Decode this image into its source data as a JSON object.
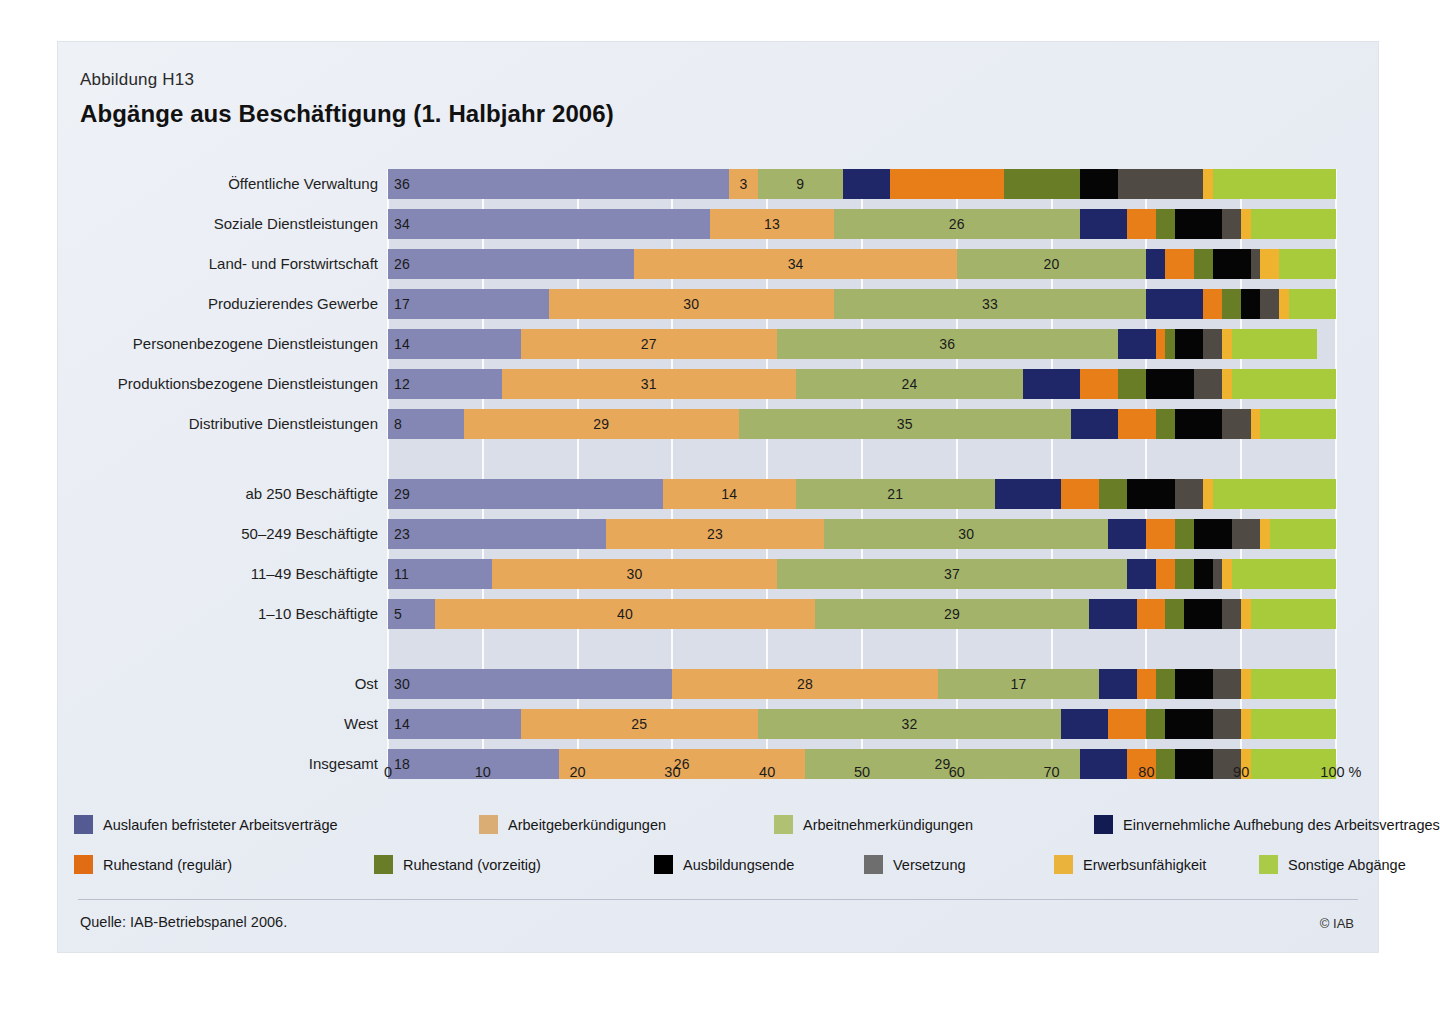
{
  "figure": {
    "number": "Abbildung H13",
    "title": "Abgänge aus Beschäftigung (1. Halbjahr 2006)",
    "source": "Quelle: IAB-Betriebspanel 2006.",
    "copyright": "© IAB"
  },
  "chart_data": {
    "type": "bar",
    "orientation": "horizontal",
    "stacked": true,
    "normalized_percent": true,
    "title": "Abgänge aus Beschäftigung (1. Halbjahr 2006)",
    "xlabel": "%",
    "ylabel": "",
    "xlim": [
      0,
      100
    ],
    "xticks": [
      "0",
      "10",
      "20",
      "30",
      "40",
      "50",
      "60",
      "70",
      "80",
      "90",
      "100 %"
    ],
    "grid": true,
    "legend_position": "bottom",
    "series": [
      {
        "name": "Auslaufen befristeter Arbeitsverträge",
        "color": "#8487b3",
        "values": [
          36,
          34,
          26,
          17,
          14,
          12,
          8,
          29,
          23,
          11,
          5,
          30,
          14,
          18
        ]
      },
      {
        "name": "Arbeitgeberkündigungen",
        "color": "#e8a85a",
        "values": [
          3,
          13,
          34,
          30,
          27,
          31,
          29,
          14,
          23,
          30,
          40,
          28,
          25,
          26
        ]
      },
      {
        "name": "Arbeitnehmerkündigungen",
        "color": "#a3b46a",
        "values": [
          9,
          26,
          20,
          33,
          36,
          24,
          35,
          21,
          30,
          37,
          29,
          17,
          32,
          29
        ]
      },
      {
        "name": "Einvernehmliche Aufhebung des Arbeitsvertrages",
        "color": "#1f2768",
        "values": [
          5,
          5,
          2,
          6,
          4,
          6,
          5,
          7,
          4,
          3,
          5,
          4,
          5,
          5
        ]
      },
      {
        "name": "Ruhestand (regulär)",
        "color": "#e87e18",
        "values": [
          12,
          3,
          3,
          2,
          1,
          4,
          4,
          4,
          3,
          2,
          3,
          2,
          4,
          3
        ]
      },
      {
        "name": "Ruhestand (vorzeitig)",
        "color": "#687d26",
        "values": [
          8,
          2,
          2,
          2,
          1,
          3,
          2,
          3,
          2,
          2,
          2,
          2,
          2,
          2
        ]
      },
      {
        "name": "Ausbildungsende",
        "color": "#050505",
        "values": [
          4,
          5,
          4,
          2,
          3,
          5,
          5,
          5,
          4,
          2,
          4,
          4,
          5,
          4
        ]
      },
      {
        "name": "Versetzung",
        "color": "#4f4a44",
        "values": [
          9,
          2,
          1,
          2,
          2,
          3,
          3,
          3,
          3,
          1,
          2,
          3,
          3,
          3
        ]
      },
      {
        "name": "Erwerbsunfähigkeit",
        "color": "#efb32f",
        "values": [
          1,
          1,
          2,
          1,
          1,
          1,
          1,
          1,
          1,
          1,
          1,
          1,
          1,
          1
        ]
      },
      {
        "name": "Sonstige Abgänge",
        "color": "#a8cb3c",
        "values": [
          13,
          9,
          6,
          5,
          9,
          11,
          8,
          13,
          7,
          11,
          9,
          9,
          9,
          9
        ]
      }
    ],
    "labeled_segments": [
      0,
      1,
      2
    ],
    "groups": [
      {
        "categories": [
          "Öffentliche Verwaltung",
          "Soziale Dienstleistungen",
          "Land- und Forstwirtschaft",
          "Produzierendes Gewerbe",
          "Personenbezogene Dienstleistungen",
          "Produktionsbezogene Dienstleistungen",
          "Distributive Dienstleistungen"
        ]
      },
      {
        "categories": [
          "ab 250 Beschäftigte",
          "50–249 Beschäftigte",
          "11–49 Beschäftigte",
          "1–10 Beschäftigte"
        ]
      },
      {
        "categories": [
          "Ost",
          "West",
          "Insgesamt"
        ]
      }
    ]
  },
  "legend": {
    "items": [
      {
        "label": "Auslaufen befristeter Arbeitsverträge",
        "color": "#545a92"
      },
      {
        "label": "Arbeitgeberkündigungen",
        "color": "#d9ad73"
      },
      {
        "label": "Arbeitnehmerkündigungen",
        "color": "#b0c173"
      },
      {
        "label": "Einvernehmliche Aufhebung des Arbeitsvertrages",
        "color": "#131c52"
      },
      {
        "label": "Ruhestand (regulär)",
        "color": "#e06c14"
      },
      {
        "label": "Ruhestand (vorzeitig)",
        "color": "#697d28"
      },
      {
        "label": "Ausbildungsende",
        "color": "#000000"
      },
      {
        "label": "Versetzung",
        "color": "#6e6e6e"
      },
      {
        "label": "Erwerbsunfähigkeit",
        "color": "#e9b33c"
      },
      {
        "label": "Sonstige Abgänge",
        "color": "#a9cb48"
      }
    ]
  }
}
